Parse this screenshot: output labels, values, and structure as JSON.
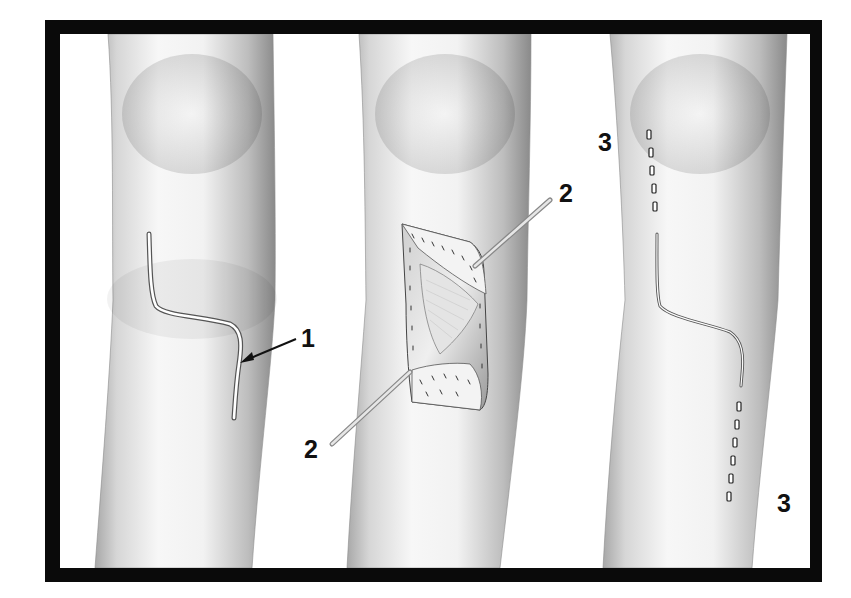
{
  "figure": {
    "frame_color": "#0a0a0a",
    "background": "#ffffff",
    "skin_light": "#f4f4f4",
    "skin_shadow": "#9a9a9a"
  },
  "panels": [
    {
      "id": "leg-1",
      "stage": "incision",
      "callouts": [
        {
          "label": "1",
          "target": "lazy-S skin incision"
        }
      ]
    },
    {
      "id": "leg-2",
      "stage": "retracted exposure",
      "callouts": [
        {
          "label": "2",
          "target": "upper retractor"
        },
        {
          "label": "2",
          "target": "lower retractor"
        }
      ]
    },
    {
      "id": "leg-3",
      "stage": "closure",
      "callouts": [
        {
          "label": "3",
          "target": "upper staple line",
          "staple_count": 5
        },
        {
          "label": "3",
          "target": "lower staple line",
          "staple_count": 6
        }
      ]
    }
  ],
  "labels": {
    "l1": "1",
    "l2a": "2",
    "l2b": "2",
    "l3a": "3",
    "l3b": "3"
  }
}
